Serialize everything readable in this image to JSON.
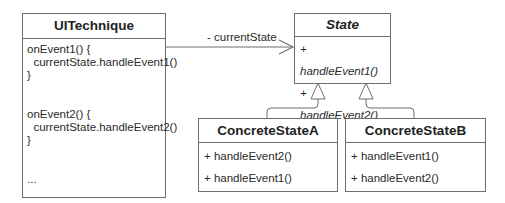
{
  "diagram": {
    "type": "uml-class-diagram",
    "classes": {
      "context": {
        "name": "UITechnique",
        "body_lines": [
          "onEvent1() {",
          "  currentState.handleEvent1()",
          "}",
          "",
          "",
          "onEvent2() {",
          "  currentState.handleEvent2()",
          "}",
          "",
          "",
          "..."
        ]
      },
      "state": {
        "name": "State",
        "abstract": true,
        "methods": [
          "+ handleEvent1()",
          "+ handleEvent2()"
        ]
      },
      "concrete_a": {
        "name": "ConcreteStateA",
        "methods": [
          "+ handleEvent2()",
          "+ handleEvent1()"
        ]
      },
      "concrete_b": {
        "name": "ConcreteStateB",
        "methods": [
          "+ handleEvent1()",
          "+ handleEvent2()"
        ]
      }
    },
    "relations": [
      {
        "type": "association",
        "from": "UITechnique",
        "to": "State",
        "label": "- currentState",
        "arrow": "open"
      },
      {
        "type": "generalization",
        "from": "ConcreteStateA",
        "to": "State"
      },
      {
        "type": "generalization",
        "from": "ConcreteStateB",
        "to": "State"
      }
    ],
    "colors": {
      "stroke": "#6e6e6e",
      "text": "#2a2a2a",
      "background": "#ffffff"
    }
  }
}
